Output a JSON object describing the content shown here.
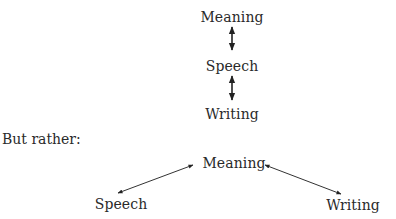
{
  "top_diagram": {
    "nodes": [
      {
        "id": "meaning",
        "label": "Meaning"
      },
      {
        "id": "speech",
        "label": "Speech"
      },
      {
        "id": "writing",
        "label": "Writing"
      }
    ],
    "edges": [
      {
        "from": "meaning",
        "to": "speech",
        "type": "bidirectional"
      },
      {
        "from": "speech",
        "to": "writing",
        "type": "bidirectional"
      }
    ]
  },
  "connector_text": "But rather:",
  "bottom_diagram": {
    "nodes": [
      {
        "id": "meaning",
        "label": "Meaning"
      },
      {
        "id": "speech",
        "label": "Speech"
      },
      {
        "id": "writing",
        "label": "Writing"
      }
    ],
    "edges": [
      {
        "from": "speech",
        "to": "meaning",
        "type": "bidirectional"
      },
      {
        "from": "meaning",
        "to": "writing",
        "type": "bidirectional"
      }
    ]
  }
}
